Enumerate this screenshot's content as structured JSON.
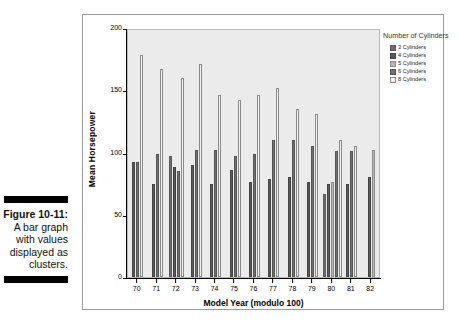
{
  "caption": {
    "figure_number": "Figure 10-11:",
    "lines": [
      "A bar graph",
      "with values",
      "displayed as",
      "clusters."
    ]
  },
  "legend": {
    "title": "Number of Cylinders",
    "items": [
      {
        "label": "3 Cylinders",
        "key": "c3",
        "color": "#6e6e6e"
      },
      {
        "label": "4 Cylinders",
        "key": "c4",
        "color": "#5a5a5a"
      },
      {
        "label": "5 Cylinders",
        "key": "c5",
        "color": "#b5b5b5"
      },
      {
        "label": "6 Cylinders",
        "key": "c6",
        "color": "#707070"
      },
      {
        "label": "8 Cylinders",
        "key": "c8",
        "color": "#f2f2f2"
      }
    ]
  },
  "chart_data": {
    "type": "bar",
    "title": "",
    "xlabel": "Model Year (modulo 100)",
    "ylabel": "Mean Horsepower",
    "categories": [
      "70",
      "71",
      "72",
      "73",
      "74",
      "75",
      "76",
      "77",
      "78",
      "79",
      "80",
      "81",
      "82"
    ],
    "ylim": [
      0,
      200
    ],
    "yticks": [
      0,
      50,
      100,
      150,
      200
    ],
    "grid": false,
    "legend_position": "right",
    "series": [
      {
        "name": "3 Cylinders",
        "key": "c3",
        "values": [
          null,
          null,
          97,
          null,
          null,
          null,
          null,
          null,
          null,
          null,
          67,
          null,
          null
        ]
      },
      {
        "name": "4 Cylinders",
        "key": "c4",
        "values": [
          92,
          75,
          88,
          90,
          75,
          86,
          76,
          79,
          80,
          76,
          75,
          75,
          80
        ]
      },
      {
        "name": "5 Cylinders",
        "key": "c5",
        "values": [
          null,
          null,
          null,
          null,
          null,
          null,
          null,
          null,
          null,
          null,
          76,
          null,
          102
        ]
      },
      {
        "name": "6 Cylinders",
        "key": "c6",
        "values": [
          92,
          99,
          85,
          102,
          102,
          97,
          99,
          110,
          110,
          105,
          101,
          101,
          null
        ]
      },
      {
        "name": "8 Cylinders",
        "key": "c8",
        "values": [
          178,
          167,
          160,
          171,
          146,
          142,
          146,
          152,
          135,
          131,
          110,
          105,
          null
        ]
      }
    ]
  }
}
